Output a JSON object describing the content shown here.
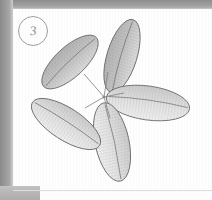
{
  "figure": {
    "label": "3",
    "label_shape": "circle",
    "medium": "pencil drawing",
    "background": "scanned white page"
  },
  "colors": {
    "page": "#fefefe",
    "scan_edge": "#9a9a9a",
    "outline": "#6f6f6f",
    "fill_dark": "#bdbdbd",
    "fill_light": "#e7e7e7",
    "vein": "#8a8a8a",
    "label_ink": "#8c8c8c"
  },
  "petals": [
    {
      "name": "upper-left-petal",
      "cx": 70,
      "cy": 62,
      "rx": 36,
      "ry": 15,
      "rotation": -43,
      "shade": "dark"
    },
    {
      "name": "top-petal",
      "cx": 122,
      "cy": 56,
      "rx": 38,
      "ry": 15,
      "rotation": -73,
      "shade": "dark"
    },
    {
      "name": "right-petal",
      "cx": 148,
      "cy": 103,
      "rx": 42,
      "ry": 17,
      "rotation": 8,
      "shade": "light"
    },
    {
      "name": "bottom-petal",
      "cx": 112,
      "cy": 142,
      "rx": 40,
      "ry": 17,
      "rotation": 78,
      "shade": "light"
    },
    {
      "name": "lower-left-petal",
      "cx": 66,
      "cy": 124,
      "rx": 40,
      "ry": 16,
      "rotation": 33,
      "shade": "light"
    }
  ],
  "center": {
    "name": "petal-junction",
    "x": 104,
    "y": 97
  }
}
